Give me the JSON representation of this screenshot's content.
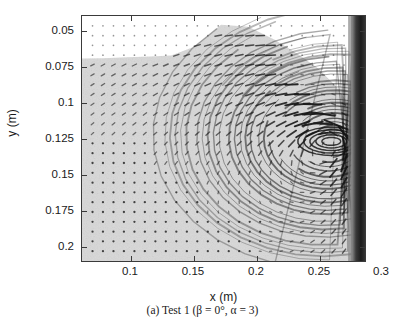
{
  "figure": {
    "kind": "piv-streak-photograph",
    "caption": {
      "label": "(a)",
      "text": "Test 1",
      "params": "(β = 0°, α = 3)",
      "full": "(a) Test 1 (β = 0°, α = 3)"
    }
  },
  "chart_data": {
    "type": "scatter",
    "title": "",
    "subtitle": "",
    "xlabel": "x (m)",
    "ylabel": "y (m)",
    "xlim": [
      0.0885,
      0.3155
    ],
    "ylim": [
      0.2095,
      0.0395
    ],
    "y_axis_inverted": true,
    "xticks": [
      0.1,
      0.15,
      0.2,
      0.25,
      0.3
    ],
    "xticklabels": [
      "0.1",
      "0.15",
      "0.2",
      "0.25",
      "0.3"
    ],
    "yticks": [
      0.05,
      0.075,
      0.1,
      0.125,
      0.15,
      0.175,
      0.2
    ],
    "yticklabels": [
      "0.05",
      "0.075",
      "0.1",
      "0.125",
      "0.15",
      "0.175",
      "0.2"
    ],
    "grid": false,
    "legend": null,
    "annotations": [],
    "background_color": "#ffffff",
    "frame_color": "#3a3a3a",
    "seeded_fluid_color": "#d6d6d6",
    "streak_color": "#1b1b1b",
    "wall_color": "#2a2a2a",
    "free_surface_profile_x": [
      0.0885,
      0.105,
      0.125,
      0.143,
      0.16,
      0.178,
      0.2,
      0.222,
      0.243,
      0.262,
      0.278,
      0.292,
      0.302,
      0.3155
    ],
    "free_surface_profile_y": [
      0.069,
      0.0688,
      0.0682,
      0.0676,
      0.0668,
      0.061,
      0.0455,
      0.047,
      0.056,
      0.066,
      0.076,
      0.088,
      0.1,
      0.108
    ],
    "vortex_center": {
      "x": 0.2885,
      "y": 0.1265
    },
    "series": [
      {
        "name": "velocity streaks",
        "description": "short dark streaks on a regular grid; length proportional to speed, direction along local flow",
        "grid_spacing_x": 0.00875,
        "grid_spacing_y": 0.0073,
        "n_columns": 26,
        "n_rows": 24
      }
    ]
  }
}
